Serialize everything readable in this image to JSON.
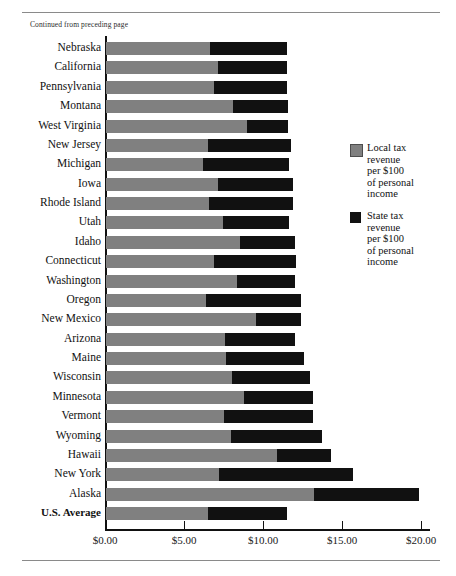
{
  "page": {
    "continued_note": "Continued from preceding page"
  },
  "chart_data": {
    "type": "bar",
    "orientation": "horizontal",
    "stacked": true,
    "title": "",
    "xlabel": "",
    "ylabel": "",
    "xlim": [
      0,
      20.5
    ],
    "grid": false,
    "legend_position": "right",
    "axis_ticks": [
      "$0.00",
      "$5.00",
      "$10.00",
      "$15.00",
      "$20.00"
    ],
    "axis_tick_values": [
      0,
      5,
      10,
      15,
      20
    ],
    "categories": [
      "Nebraska",
      "California",
      "Pennsylvania",
      "Montana",
      "West Virginia",
      "New Jersey",
      "Michigan",
      "Iowa",
      "Rhode Island",
      "Utah",
      "Idaho",
      "Connecticut",
      "Washington",
      "Oregon",
      "New Mexico",
      "Arizona",
      "Maine",
      "Wisconsin",
      "Minnesota",
      "Vermont",
      "Wyoming",
      "Hawaii",
      "New York",
      "Alaska",
      "U.S. Average"
    ],
    "emphasized_categories": [
      "U.S. Average"
    ],
    "series": [
      {
        "name": "Local tax revenue per $100 of personal income",
        "color": "#808080",
        "values": [
          6.58,
          7.09,
          6.84,
          8.04,
          8.92,
          6.46,
          6.14,
          7.09,
          6.52,
          7.41,
          8.48,
          6.84,
          8.29,
          6.33,
          9.49,
          7.53,
          7.59,
          7.97,
          8.73,
          7.47,
          7.91,
          10.82,
          7.15,
          13.16,
          6.46
        ]
      },
      {
        "name": "State tax revenue per $100 of personal income",
        "color": "#111111",
        "values": [
          4.87,
          4.37,
          4.62,
          3.48,
          2.59,
          5.25,
          5.44,
          4.75,
          5.32,
          4.18,
          3.48,
          5.17,
          3.67,
          5.99,
          2.85,
          4.46,
          4.97,
          4.94,
          4.37,
          5.63,
          5.76,
          3.42,
          8.47,
          6.65,
          5.0
        ]
      }
    ],
    "totals": [
      11.45,
      11.46,
      11.46,
      11.52,
      11.51,
      11.71,
      11.58,
      11.84,
      11.84,
      11.59,
      11.96,
      12.01,
      11.96,
      12.32,
      12.34,
      11.99,
      12.56,
      12.91,
      13.1,
      13.1,
      13.67,
      14.24,
      15.62,
      19.81,
      11.46
    ]
  },
  "legend": {
    "items": [
      {
        "swatch": "local",
        "lines": [
          "Local tax",
          "revenue",
          "per $100",
          "of personal",
          "income"
        ]
      },
      {
        "swatch": "state",
        "lines": [
          "State tax",
          "revenue",
          "per $100",
          "of personal",
          "income"
        ]
      }
    ]
  },
  "colors": {
    "local": "#808080",
    "state": "#111111",
    "axis": "#111111",
    "rule": "#8a8a8a"
  }
}
